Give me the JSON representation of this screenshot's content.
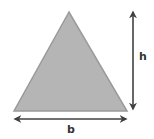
{
  "diagram": {
    "type": "triangle-dimensions",
    "shape": "triangle",
    "labels": {
      "base": "b",
      "height": "h"
    },
    "colors": {
      "fill": "#b5b5b5",
      "stroke": "#9a9a9a",
      "arrow": "#404040"
    }
  }
}
